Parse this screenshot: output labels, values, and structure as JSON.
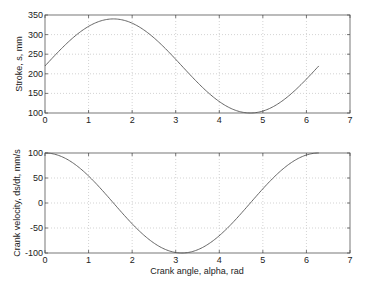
{
  "chart_data": [
    {
      "type": "line",
      "title": "",
      "xlabel": "",
      "ylabel": "Stroke, s, mm",
      "xlim": [
        0,
        7
      ],
      "ylim": [
        100,
        350
      ],
      "xticks": [
        0,
        1,
        2,
        3,
        4,
        5,
        6,
        7
      ],
      "yticks": [
        100,
        150,
        200,
        250,
        300,
        350
      ],
      "grid": true,
      "series": [
        {
          "name": "stroke",
          "formula": "220 + 120*sin(alpha)",
          "x": [
            0,
            0.5,
            1.0,
            1.5708,
            2.0,
            2.5,
            3.0,
            3.1416,
            3.5,
            4.0,
            4.7124,
            5.0,
            5.5,
            6.0,
            6.2832
          ],
          "values": [
            220,
            277.5,
            321,
            340,
            329,
            292,
            237,
            220,
            178,
            129,
            100,
            105,
            136,
            186,
            220
          ]
        }
      ]
    },
    {
      "type": "line",
      "title": "",
      "xlabel": "Crank angle, alpha, rad",
      "ylabel": "Crank velocity, ds/dt, mm/s",
      "xlim": [
        0,
        7
      ],
      "ylim": [
        -100,
        100
      ],
      "xticks": [
        0,
        1,
        2,
        3,
        4,
        5,
        6,
        7
      ],
      "yticks": [
        -100,
        -50,
        0,
        50,
        100
      ],
      "grid": true,
      "series": [
        {
          "name": "velocity",
          "formula": "100*cos(alpha)",
          "x": [
            0,
            0.5,
            1.0,
            1.5708,
            2.0,
            2.5,
            3.0,
            3.1416,
            3.5,
            4.0,
            4.7124,
            5.0,
            5.5,
            6.0,
            6.2832
          ],
          "values": [
            100,
            88,
            54,
            0,
            -42,
            -80,
            -99,
            -100,
            -94,
            -65,
            0,
            28,
            71,
            96,
            100
          ]
        }
      ]
    }
  ],
  "labels": {
    "top_ylabel": "Stroke, s, mm",
    "bottom_ylabel": "Crank velocity, ds/dt, mm/s",
    "bottom_xlabel": "Crank angle, alpha, rad"
  }
}
